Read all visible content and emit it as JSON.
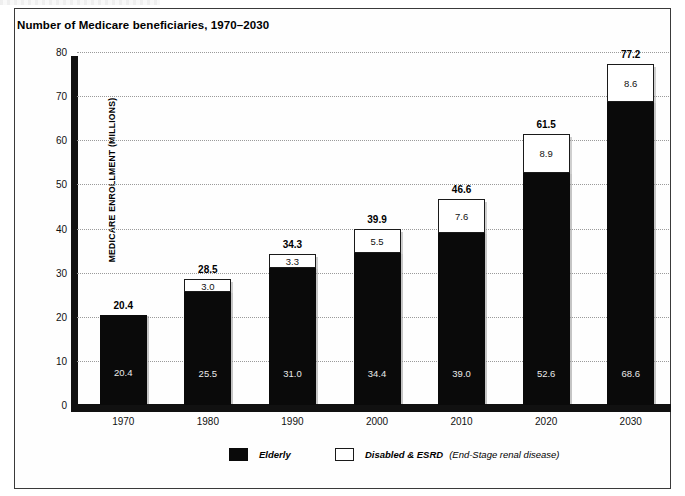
{
  "figure": {
    "title": "Number of Medicare beneficiaries, 1970–2030"
  },
  "axes": {
    "y_title": "MEDICARE ENROLLMENT (MILLIONS)",
    "y_ticks": [
      "0",
      "10",
      "20",
      "30",
      "40",
      "50",
      "60",
      "70",
      "80"
    ],
    "x_ticks": [
      "1970",
      "1980",
      "1990",
      "2000",
      "2010",
      "2020",
      "2030"
    ]
  },
  "legend": {
    "elderly_label": "Elderly",
    "disabled_label": "Disabled & ESRD",
    "disabled_sublabel": "(End-Stage renal disease)",
    "elderly_color": "#0a0a0a",
    "disabled_color": "#ffffff"
  },
  "bars": [
    {
      "year": "1970",
      "elderly": "20.4",
      "esrd": "",
      "total": "20.4"
    },
    {
      "year": "1980",
      "elderly": "25.5",
      "esrd": "3.0",
      "total": "28.5"
    },
    {
      "year": "1990",
      "elderly": "31.0",
      "esrd": "3.3",
      "total": "34.3"
    },
    {
      "year": "2000",
      "elderly": "34.4",
      "esrd": "5.5",
      "total": "39.9"
    },
    {
      "year": "2010",
      "elderly": "39.0",
      "esrd": "7.6",
      "total": "46.6"
    },
    {
      "year": "2020",
      "elderly": "52.6",
      "esrd": "8.9",
      "total": "61.5"
    },
    {
      "year": "2030",
      "elderly": "68.6",
      "esrd": "8.6",
      "total": "77.2"
    }
  ],
  "chart_data": {
    "type": "bar",
    "title": "Number of Medicare beneficiaries, 1970–2030",
    "subtitle": "",
    "xlabel": "",
    "ylabel": "MEDICARE ENROLLMENT (MILLIONS)",
    "categories": [
      "1970",
      "1980",
      "1990",
      "2000",
      "2010",
      "2020",
      "2030"
    ],
    "series": [
      {
        "name": "Elderly",
        "color": "#0a0a0a",
        "values": [
          20.4,
          25.5,
          31.0,
          34.4,
          39.0,
          52.6,
          68.6
        ]
      },
      {
        "name": "Disabled & ESRD (End-Stage renal disease)",
        "color": "#ffffff",
        "values": [
          0,
          3.0,
          3.3,
          5.5,
          7.6,
          8.9,
          8.6
        ]
      }
    ],
    "totals": [
      20.4,
      28.5,
      34.3,
      39.9,
      46.6,
      61.5,
      77.2
    ],
    "stacked": true,
    "ylim": [
      0,
      80
    ],
    "ytick_step": 10,
    "grid": "horizontal-dotted",
    "legend_position": "bottom"
  }
}
